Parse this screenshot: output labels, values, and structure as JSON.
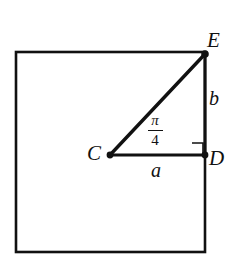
{
  "figure": {
    "background_color": "#ffffff",
    "stroke_color": "#111111",
    "square": {
      "name": "outer-square",
      "x": 16,
      "y": 52,
      "width": 189,
      "height": 200,
      "stroke_width": 2.6
    },
    "points": [
      {
        "id": "C",
        "label": "C",
        "x": 110,
        "y": 155,
        "dot": true,
        "dot_radius": 3.4
      },
      {
        "id": "D",
        "label": "D",
        "x": 205,
        "y": 155,
        "dot": true,
        "dot_radius": 3.4
      },
      {
        "id": "E",
        "label": "E",
        "x": 205,
        "y": 54,
        "dot": true,
        "dot_radius": 3.8
      }
    ],
    "segments": [
      {
        "id": "CD",
        "from": "C",
        "to": "D",
        "label": "a",
        "stroke_width": 3.0
      },
      {
        "id": "DE",
        "from": "D",
        "to": "E",
        "label": "b",
        "stroke_width": 3.0
      },
      {
        "id": "CE",
        "from": "C",
        "to": "E",
        "label": "",
        "stroke_width": 3.4
      }
    ],
    "right_angle_marker": {
      "at": "D",
      "x": 192,
      "y": 143,
      "size": 11,
      "stroke_width": 1.6
    },
    "angle_at_C": {
      "numerator": "π",
      "denominator": "4",
      "value_text": "π/4"
    }
  }
}
